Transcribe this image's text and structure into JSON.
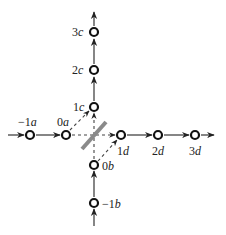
{
  "diagram": {
    "title": "",
    "colors": {
      "line": "#333333",
      "node": "#111111",
      "splitter": "#8a8a8a",
      "background": "#ffffff"
    },
    "nodes": {
      "c3": {
        "num": "3",
        "var": "c"
      },
      "c2": {
        "num": "2",
        "var": "c"
      },
      "c1": {
        "num": "1",
        "var": "c"
      },
      "am1": {
        "num": "−1",
        "var": "a"
      },
      "a0": {
        "num": "0",
        "var": "a"
      },
      "d1": {
        "num": "1",
        "var": "d"
      },
      "d2": {
        "num": "2",
        "var": "d"
      },
      "d3": {
        "num": "3",
        "var": "d"
      },
      "b0": {
        "num": "0",
        "var": "b"
      },
      "bm1": {
        "num": "−1",
        "var": "b"
      }
    },
    "components": {
      "beam_splitter": "beam-splitter",
      "dashed_edges": [
        "0a-1c",
        "0a-1d",
        "0b-1c",
        "0b-1d"
      ]
    }
  }
}
